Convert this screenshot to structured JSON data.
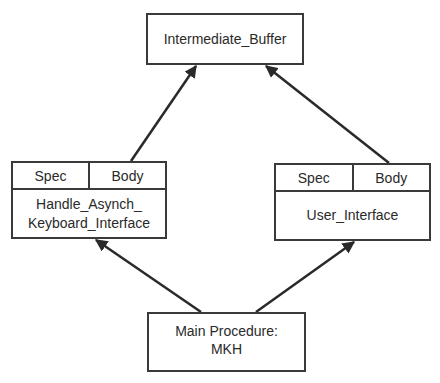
{
  "diagram": {
    "type": "package-dependency",
    "nodes": {
      "intermediate_buffer": {
        "label": "Intermediate_Buffer"
      },
      "handle_asynch": {
        "spec_label": "Spec",
        "body_label": "Body",
        "label": "Handle_Asynch_\nKeyboard_Interface"
      },
      "user_interface": {
        "spec_label": "Spec",
        "body_label": "Body",
        "label": "User_Interface"
      },
      "main_procedure": {
        "label": "Main Procedure:\nMKH"
      }
    },
    "edges": [
      {
        "from": "main_procedure",
        "to": "handle_asynch"
      },
      {
        "from": "main_procedure",
        "to": "user_interface"
      },
      {
        "from": "handle_asynch",
        "to": "intermediate_buffer"
      },
      {
        "from": "user_interface",
        "to": "intermediate_buffer"
      }
    ],
    "colors": {
      "stroke": "#3a3a3a",
      "background": "#ffffff",
      "text": "#2a2a2a"
    }
  }
}
